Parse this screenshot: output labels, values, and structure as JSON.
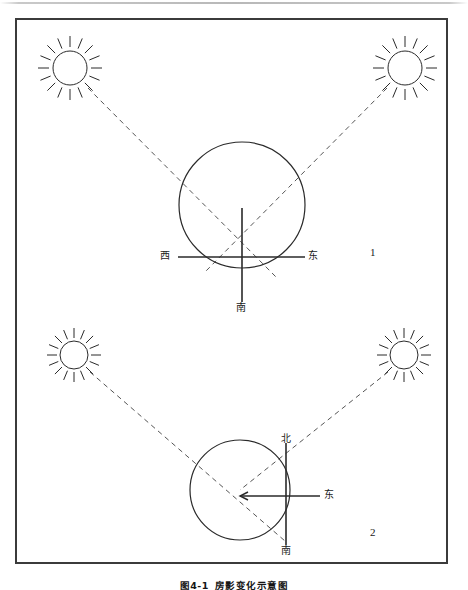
{
  "figure": {
    "caption_number": "图4-1",
    "caption_text": "房影变化示意图",
    "frame": {
      "border_color": "#3b3b3b"
    },
    "line_color": "#2a2a2a",
    "dashed_color": "#555555"
  },
  "panels": [
    {
      "id": "panel-1",
      "number": "1",
      "number_pos": {
        "x": 370,
        "y": 247
      },
      "circle": {
        "cx": 242,
        "cy": 205,
        "r": 63
      },
      "suns": [
        {
          "name": "sun-morning",
          "cx": 70,
          "cy": 68,
          "r": 17,
          "rays": 16,
          "ray_inner": 21,
          "ray_outer": 32
        },
        {
          "name": "sun-afternoon",
          "cx": 405,
          "cy": 68,
          "r": 17,
          "rays": 16,
          "ray_inner": 21,
          "ray_outer": 32
        }
      ],
      "rays_to_center": [
        {
          "name": "ray-from-morning-sun",
          "x1": 88,
          "y1": 88,
          "x2": 276,
          "y2": 277
        },
        {
          "name": "ray-from-afternoon-sun",
          "x1": 387,
          "y1": 88,
          "x2": 205,
          "y2": 272
        }
      ],
      "axes": {
        "horizontal": {
          "x1": 178,
          "y1": 257,
          "x2": 305,
          "y2": 257
        },
        "vertical": {
          "x1": 242,
          "y1": 208,
          "x2": 242,
          "y2": 302
        }
      },
      "labels": [
        {
          "name": "label-west",
          "text": "西",
          "x": 160,
          "y": 251
        },
        {
          "name": "label-east",
          "text": "东",
          "x": 308,
          "y": 251
        },
        {
          "name": "label-south",
          "text": "南",
          "x": 236,
          "y": 303
        }
      ]
    },
    {
      "id": "panel-2",
      "number": "2",
      "number_pos": {
        "x": 370,
        "y": 527
      },
      "circle": {
        "cx": 240,
        "cy": 490,
        "r": 50
      },
      "suns": [
        {
          "name": "sun-morning",
          "cx": 74,
          "cy": 355,
          "r": 14,
          "rays": 16,
          "ray_inner": 17,
          "ray_outer": 27
        },
        {
          "name": "sun-afternoon",
          "cx": 404,
          "cy": 355,
          "r": 14,
          "rays": 16,
          "ray_inner": 17,
          "ray_outer": 27
        }
      ],
      "rays_to_center": [
        {
          "name": "ray-from-morning-sun",
          "x1": 90,
          "y1": 372,
          "x2": 285,
          "y2": 541
        },
        {
          "name": "ray-from-afternoon-sun",
          "x1": 388,
          "y1": 372,
          "x2": 240,
          "y2": 490
        }
      ],
      "axes": {
        "vertical": {
          "x1": 286,
          "y1": 443,
          "x2": 286,
          "y2": 545
        },
        "horizontal_arrow": {
          "x1": 320,
          "y1": 496,
          "x2": 240,
          "y2": 496
        }
      },
      "labels": [
        {
          "name": "label-north",
          "text": "北",
          "x": 281,
          "y": 434
        },
        {
          "name": "label-east",
          "text": "东",
          "x": 324,
          "y": 490
        },
        {
          "name": "label-south",
          "text": "南",
          "x": 281,
          "y": 546
        }
      ]
    }
  ]
}
